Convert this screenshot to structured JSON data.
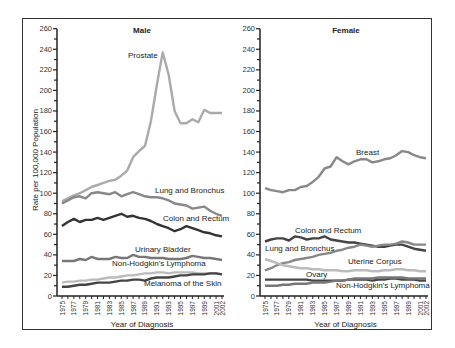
{
  "chart_data": [
    {
      "type": "line",
      "title": "Male",
      "xlabel": "Year of Diagnosis",
      "ylabel": "Rate per 100,000 Population",
      "ylim": [
        0,
        260
      ],
      "yticks": [
        0,
        20,
        40,
        60,
        80,
        100,
        120,
        140,
        160,
        180,
        200,
        220,
        240,
        260
      ],
      "xtick_labels": [
        "1975",
        "1977",
        "1979",
        "1981",
        "1983",
        "1985",
        "1987",
        "1989",
        "1991",
        "1993",
        "1995",
        "1997",
        "1999",
        "2001",
        "2002"
      ],
      "x": [
        1975,
        1976,
        1977,
        1978,
        1979,
        1980,
        1981,
        1982,
        1983,
        1984,
        1985,
        1986,
        1987,
        1988,
        1989,
        1990,
        1991,
        1992,
        1993,
        1994,
        1995,
        1996,
        1997,
        1998,
        1999,
        2000,
        2001,
        2002
      ],
      "grid": false,
      "series": [
        {
          "name": "Prostate",
          "color": "#aaaaaa",
          "label_pos": [
            128,
            58
          ],
          "values": [
            92,
            95,
            98,
            100,
            103,
            106,
            108,
            110,
            112,
            113,
            117,
            122,
            135,
            141,
            146,
            170,
            205,
            237,
            215,
            180,
            168,
            168,
            172,
            169,
            181,
            178,
            178,
            178
          ]
        },
        {
          "name": "Lung and Bronchus",
          "color": "#888888",
          "label_pos": [
            155,
            193
          ],
          "values": [
            90,
            93,
            96,
            97,
            95,
            100,
            101,
            100,
            99,
            101,
            97,
            99,
            101,
            99,
            97,
            96,
            96,
            95,
            93,
            90,
            89,
            88,
            85,
            86,
            87,
            83,
            80,
            78
          ]
        },
        {
          "name": "Colon and Rectum",
          "color": "#333333",
          "label_pos": [
            163,
            221
          ],
          "values": [
            68,
            72,
            75,
            72,
            74,
            74,
            76,
            74,
            76,
            78,
            80,
            77,
            78,
            76,
            75,
            73,
            70,
            68,
            66,
            63,
            65,
            68,
            66,
            64,
            62,
            61,
            59,
            58
          ]
        },
        {
          "name": "Urinary Bladder",
          "color": "#777777",
          "label_pos": [
            135,
            252
          ],
          "values": [
            34,
            34,
            34,
            36,
            35,
            38,
            36,
            36,
            36,
            38,
            37,
            37,
            40,
            38,
            38,
            37,
            37,
            37,
            36,
            36,
            36,
            37,
            39,
            38,
            37,
            37,
            36,
            35
          ]
        },
        {
          "name": "Non-Hodgkin's Lymphoma",
          "color": "#bbbbbb",
          "label_pos": [
            112,
            266
          ],
          "values": [
            13,
            14,
            14,
            15,
            15,
            16,
            16,
            17,
            18,
            18,
            19,
            20,
            20,
            21,
            22,
            22,
            23,
            23,
            22,
            23,
            23,
            23,
            23,
            22,
            22,
            22,
            22,
            21
          ]
        },
        {
          "name": "Melanoma of the Skin",
          "color": "#444444",
          "label_pos": [
            144,
            286
          ],
          "values": [
            9,
            9,
            10,
            11,
            11,
            12,
            13,
            13,
            13,
            14,
            15,
            15,
            16,
            16,
            15,
            17,
            18,
            18,
            18,
            19,
            20,
            20,
            21,
            21,
            21,
            22,
            22,
            21
          ]
        }
      ]
    },
    {
      "type": "line",
      "title": "Female",
      "xlabel": "Year of Diagnosis",
      "ylabel": "",
      "ylim": [
        0,
        260
      ],
      "yticks": [
        0,
        20,
        40,
        60,
        80,
        100,
        120,
        140,
        160,
        180,
        200,
        220,
        240,
        260
      ],
      "xtick_labels": [
        "1975",
        "1977",
        "1979",
        "1981",
        "1983",
        "1985",
        "1987",
        "1989",
        "1991",
        "1993",
        "1995",
        "1997",
        "1999",
        "2001",
        "2002"
      ],
      "x": [
        1975,
        1976,
        1977,
        1978,
        1979,
        1980,
        1981,
        1982,
        1983,
        1984,
        1985,
        1986,
        1987,
        1988,
        1989,
        1990,
        1991,
        1992,
        1993,
        1994,
        1995,
        1996,
        1997,
        1998,
        1999,
        2000,
        2001,
        2002
      ],
      "grid": false,
      "series": [
        {
          "name": "Breast",
          "color": "#888888",
          "label_pos": [
            356,
            155
          ],
          "values": [
            105,
            103,
            102,
            101,
            103,
            103,
            106,
            107,
            111,
            116,
            124,
            126,
            135,
            131,
            128,
            131,
            133,
            133,
            130,
            131,
            133,
            134,
            137,
            141,
            140,
            137,
            135,
            134
          ]
        },
        {
          "name": "Colon and Rectum",
          "color": "#444444",
          "label_pos": [
            295,
            233
          ],
          "values": [
            53,
            55,
            56,
            56,
            54,
            58,
            57,
            55,
            56,
            56,
            58,
            55,
            54,
            53,
            52,
            52,
            51,
            50,
            49,
            48,
            48,
            49,
            50,
            50,
            48,
            46,
            45,
            44
          ]
        },
        {
          "name": "Lung and Bronchus",
          "color": "#888888",
          "label_pos": [
            265,
            251
          ],
          "values": [
            25,
            27,
            30,
            32,
            33,
            35,
            36,
            37,
            38,
            40,
            41,
            42,
            44,
            45,
            47,
            48,
            50,
            49,
            48,
            49,
            50,
            50,
            51,
            53,
            52,
            50,
            50,
            50
          ]
        },
        {
          "name": "Uterine Corpus",
          "color": "#bbbbbb",
          "label_pos": [
            348,
            264
          ],
          "values": [
            36,
            34,
            32,
            30,
            29,
            28,
            27,
            27,
            26,
            26,
            25,
            25,
            25,
            24,
            24,
            25,
            25,
            25,
            24,
            24,
            25,
            25,
            26,
            26,
            25,
            25,
            24,
            24
          ]
        },
        {
          "name": "Ovary",
          "color": "#444444",
          "label_pos": [
            306,
            277
          ],
          "values": [
            16,
            16,
            16,
            16,
            16,
            16,
            16,
            16,
            15,
            15,
            15,
            15,
            15,
            15,
            16,
            16,
            16,
            16,
            15,
            16,
            16,
            17,
            17,
            16,
            16,
            16,
            15,
            15
          ]
        },
        {
          "name": "Non-Hodgkin's Lymphoma",
          "color": "#777777",
          "label_pos": [
            336,
            288
          ],
          "values": [
            10,
            10,
            10,
            11,
            11,
            12,
            12,
            12,
            13,
            13,
            13,
            14,
            15,
            15,
            16,
            17,
            17,
            17,
            17,
            18,
            18,
            18,
            18,
            18,
            17,
            17,
            17,
            17
          ]
        }
      ]
    }
  ]
}
